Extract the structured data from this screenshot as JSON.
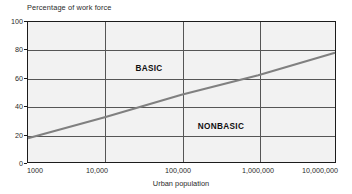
{
  "chart_data": {
    "type": "line",
    "title": "",
    "ylabel": "Percentage of work force",
    "xlabel": "Urban population",
    "x_scale": "log",
    "xlim": [
      1000,
      10000000
    ],
    "ylim": [
      0,
      100
    ],
    "x_ticks": [
      {
        "value": 1000,
        "label": "1000",
        "align": "left",
        "px": 27
      },
      {
        "value": 10000,
        "label": "10,000",
        "align": "center",
        "px": 97
      },
      {
        "value": 100000,
        "label": "100,000",
        "align": "center",
        "px": 178
      },
      {
        "value": 1000000,
        "label": "1,000,000",
        "align": "center",
        "px": 258
      },
      {
        "value": 10000000,
        "label": "10,000,000",
        "align": "center",
        "px": 320
      }
    ],
    "y_ticks": [
      {
        "value": 100,
        "label": "100"
      },
      {
        "value": 80,
        "label": "80"
      },
      {
        "value": 60,
        "label": "60"
      },
      {
        "value": 40,
        "label": "40"
      },
      {
        "value": 20,
        "label": "20"
      },
      {
        "value": 0,
        "label": "0"
      }
    ],
    "grid": {
      "horizontal": [
        20,
        40,
        60,
        80
      ],
      "vertical": [
        10000,
        100000,
        1000000
      ]
    },
    "series": [
      {
        "name": "basic-nonbasic-divide",
        "color": "#808080",
        "width": 2.2,
        "points": [
          {
            "x": 1000,
            "y": 17
          },
          {
            "x": 10000,
            "y": 32
          },
          {
            "x": 100000,
            "y": 48
          },
          {
            "x": 1000000,
            "y": 62
          },
          {
            "x": 10000000,
            "y": 78
          }
        ]
      }
    ],
    "annotations": [
      {
        "text": "BASIC",
        "x_px": 148,
        "y_px": 67
      },
      {
        "text": "NONBASIC",
        "x_px": 220,
        "y_px": 125
      }
    ],
    "legend": null,
    "plot_bg": "#f2f2f2",
    "frame_color": "#1c1c1c",
    "grid_color": "#565656"
  }
}
